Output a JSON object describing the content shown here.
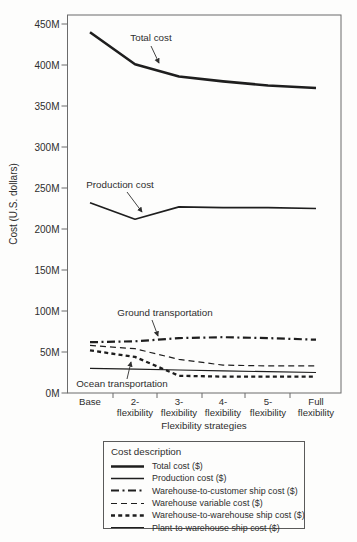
{
  "chart_data": {
    "type": "line",
    "title": "",
    "xlabel": "Flexibility strategies",
    "ylabel": "Cost (U.S. dollars)",
    "ylim": [
      0,
      450
    ],
    "y_tick_step": 50,
    "y_tick_labels": [
      "450M",
      "400M",
      "350M",
      "300M",
      "250M",
      "200M",
      "150M",
      "100M",
      "50M",
      "0M"
    ],
    "grid": "off",
    "legend_position": "bottom",
    "categories": [
      [
        "Base"
      ],
      [
        "2-",
        "flexibility"
      ],
      [
        "3-",
        "flexibility"
      ],
      [
        "4-",
        "flexibility"
      ],
      [
        "5-",
        "flexibility"
      ],
      [
        "Full",
        "flexibility"
      ]
    ],
    "series": [
      {
        "name": "Total cost ($)",
        "style": "solid-thick",
        "values": [
          440,
          401,
          386,
          380,
          375,
          372
        ]
      },
      {
        "name": "Production cost ($)",
        "style": "solid-medium",
        "values": [
          232,
          212,
          227,
          226,
          226,
          225
        ]
      },
      {
        "name": "Warehouse-to-customer ship cost ($)",
        "style": "dashdot-thick",
        "values": [
          62,
          63,
          67,
          68,
          67,
          65
        ]
      },
      {
        "name": "Warehouse variable cost ($)",
        "style": "dash-thin",
        "values": [
          58,
          54,
          41,
          34,
          33,
          33
        ]
      },
      {
        "name": "Warehouse-to-warehouse ship cost ($)",
        "style": "shortdash-thick",
        "values": [
          52,
          44,
          21,
          20,
          20,
          20
        ]
      },
      {
        "name": "Plant-to-warehouse ship cost ($)",
        "style": "solid-thin",
        "values": [
          30,
          29,
          28,
          27,
          26,
          25
        ]
      }
    ],
    "annotations": [
      {
        "text": "Total cost",
        "x": 151,
        "y": 41,
        "arrow": {
          "x1": 151,
          "y1": 46,
          "x2": 159,
          "y2": 63
        }
      },
      {
        "text": "Production cost",
        "x": 120,
        "y": 188,
        "arrow": {
          "x1": 127,
          "y1": 192,
          "x2": 142,
          "y2": 212
        }
      },
      {
        "text": "Ground transportation",
        "x": 165,
        "y": 316,
        "arrow": {
          "x1": 152,
          "y1": 320,
          "x2": 158,
          "y2": 336
        }
      },
      {
        "text": "Ocean transportation",
        "x": 122,
        "y": 387,
        "arrow": {
          "x1": 127,
          "y1": 379,
          "x2": 131,
          "y2": 362
        }
      }
    ]
  },
  "legend": {
    "title": "Cost description",
    "items": [
      {
        "label": "Total cost ($)",
        "style": "solid-thick"
      },
      {
        "label": "Production cost ($)",
        "style": "solid-medium"
      },
      {
        "label": "Warehouse-to-customer ship cost ($)",
        "style": "dashdot-thick"
      },
      {
        "label": "Warehouse variable cost ($)",
        "style": "dash-thin"
      },
      {
        "label": "Warehouse-to-warehouse ship cost ($)",
        "style": "shortdash-thick"
      },
      {
        "label": "Plant-to-warehouse ship cost ($)",
        "style": "solid-thin"
      }
    ]
  }
}
